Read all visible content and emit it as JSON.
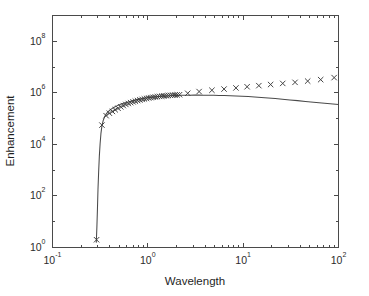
{
  "chart_data": {
    "type": "scatter",
    "title": "",
    "xlabel": "Wavelength",
    "ylabel": "Enhancement",
    "xscale": "log",
    "yscale": "log",
    "xlim": [
      0.1,
      100
    ],
    "ylim": [
      1,
      1000000000
    ],
    "grid": false,
    "legend": "none",
    "xticks": [
      0.1,
      1,
      10,
      100
    ],
    "xticklabels": [
      "10-1",
      "100",
      "101",
      "102"
    ],
    "yticks": [
      1,
      100,
      10000,
      1000000,
      100000000
    ],
    "yticklabels": [
      "100",
      "102",
      "104",
      "106",
      "108"
    ],
    "series": [
      {
        "name": "model curve",
        "type": "line",
        "marker": "none",
        "linestyle": "solid",
        "color": "#4a4a4a",
        "x": [
          0.288,
          0.292,
          0.296,
          0.3,
          0.305,
          0.31,
          0.316,
          0.322,
          0.33,
          0.34,
          0.352,
          0.366,
          0.382,
          0.4,
          0.42,
          0.443,
          0.468,
          0.495,
          0.525,
          0.558,
          0.594,
          0.633,
          0.676,
          0.723,
          0.775,
          0.832,
          0.895,
          0.964,
          1.04,
          1.12,
          1.21,
          1.31,
          1.42,
          1.55,
          1.69,
          1.85,
          2.03,
          2.24,
          2.48,
          2.75,
          3.06,
          3.42,
          3.84,
          4.33,
          4.9,
          5.57,
          6.36,
          7.3,
          8.41,
          9.73,
          11.3,
          13.2,
          15.5,
          18.3,
          21.7,
          25.8,
          30.9,
          37.2,
          45.0,
          54.7,
          66.8,
          81.8,
          100.0
        ],
        "y": [
          1.6,
          6.0,
          30,
          180,
          900,
          3500,
          11000.0,
          26000.0,
          52000.0,
          84000.0,
          118000.0,
          152000.0,
          184000.0,
          215000.0,
          245000.0,
          275000.0,
          305000.0,
          335000.0,
          365000.0,
          395000.0,
          425000.0,
          455000.0,
          485000.0,
          515000.0,
          545000.0,
          575000.0,
          605000.0,
          632000.0,
          658000.0,
          682000.0,
          704000.0,
          724000.0,
          742000.0,
          758000.0,
          772000.0,
          784000.0,
          794000.0,
          802000.0,
          808000.0,
          812000.0,
          814000.0,
          814000.0,
          812000.0,
          808000.0,
          802000.0,
          794000.0,
          784000.0,
          770000.0,
          754000.0,
          736000.0,
          714000.0,
          690000.0,
          662000.0,
          632000.0,
          600000.0,
          566000.0,
          532000.0,
          498000.0,
          464000.0,
          432000.0,
          402000.0,
          376000.0,
          354000.0
        ]
      },
      {
        "name": "measured data",
        "type": "scatter",
        "marker": "x",
        "color": "#3c3c3c",
        "x": [
          0.29,
          0.33,
          0.365,
          0.395,
          0.425,
          0.455,
          0.487,
          0.52,
          0.553,
          0.588,
          0.624,
          0.661,
          0.7,
          0.74,
          0.782,
          0.826,
          0.872,
          0.92,
          0.97,
          1.022,
          1.077,
          1.135,
          1.196,
          1.26,
          1.328,
          1.4,
          1.476,
          1.556,
          1.64,
          1.73,
          1.825,
          1.925,
          2.03,
          2.15,
          2.62,
          3.45,
          4.7,
          6.3,
          8.4,
          11.0,
          14.6,
          19.4,
          26.0,
          35.0,
          47.5,
          65.0,
          90.0
        ],
        "y": [
          2.0,
          56000.0,
          130000.0,
          162000.0,
          190000.0,
          220000.0,
          252000.0,
          286000.0,
          320000.0,
          354000.0,
          386000.0,
          416000.0,
          446000.0,
          474000.0,
          502000.0,
          530000.0,
          556000.0,
          582000.0,
          606000.0,
          630000.0,
          652000.0,
          672000.0,
          692000.0,
          710000.0,
          728000.0,
          744000.0,
          760000.0,
          774000.0,
          788000.0,
          800000.0,
          812000.0,
          822000.0,
          832000.0,
          846000.0,
          960000.0,
          1120000.0,
          1260000.0,
          1400000.0,
          1550000.0,
          1720000.0,
          1900000.0,
          2100000.0,
          2320000.0,
          2550000.0,
          2850000.0,
          3250000.0,
          3900000.0
        ]
      }
    ]
  },
  "axes": {
    "x_label": "Wavelength",
    "y_label": "Enhancement"
  }
}
